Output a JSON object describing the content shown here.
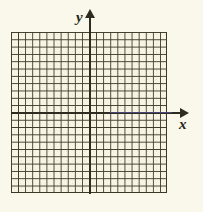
{
  "figure": {
    "type": "coordinate-grid",
    "background_color": "#faf8ea",
    "grid_fill_color": "#f7f4e4",
    "grid_line_color": "#3b3826",
    "axis_color": "#2e2c20",
    "axis_tint_color": "#4a4a86"
  },
  "axes": {
    "x": {
      "label": "x",
      "arrow": "right-arrow-icon",
      "columns": 22
    },
    "y": {
      "label": "y",
      "arrow": "up-arrow-icon",
      "rows": 22
    }
  },
  "chart_data": {
    "type": "scatter",
    "title": "",
    "xlabel": "x",
    "ylabel": "y",
    "x": [],
    "y": [],
    "series": [],
    "xlim": [
      -11,
      11
    ],
    "ylim": [
      -11,
      11
    ],
    "grid": true,
    "grid_columns": 22,
    "grid_rows": 22,
    "legend": null,
    "annotations": []
  }
}
